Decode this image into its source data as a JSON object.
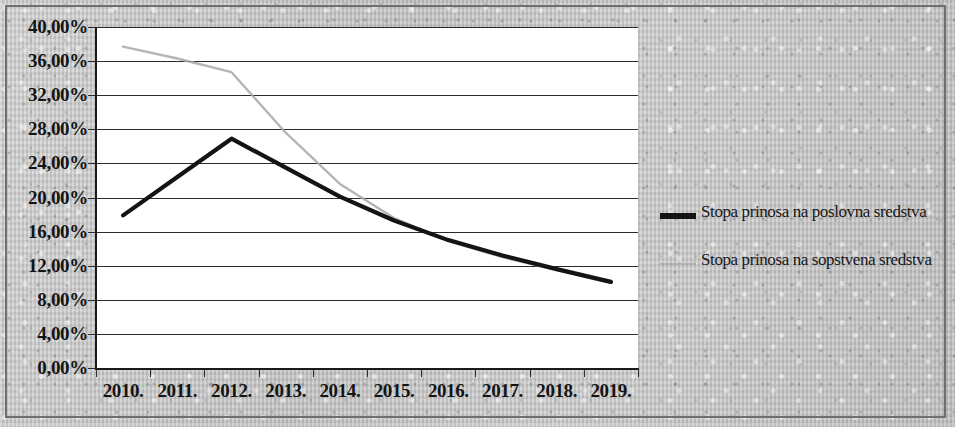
{
  "chart_data": {
    "type": "line",
    "title": "",
    "xlabel": "",
    "ylabel": "",
    "categories": [
      "2010.",
      "2011.",
      "2012.",
      "2013.",
      "2014.",
      "2015.",
      "2016.",
      "2017.",
      "2018.",
      "2019."
    ],
    "ylim": [
      0,
      40
    ],
    "y_tick_step": 4,
    "y_tick_labels": [
      "0,00%",
      "4,00%",
      "8,00%",
      "12,00%",
      "16,00%",
      "20,00%",
      "24,00%",
      "28,00%",
      "32,00%",
      "36,00%",
      "40,00%"
    ],
    "y_tick_values": [
      0,
      4,
      8,
      12,
      16,
      20,
      24,
      28,
      32,
      36,
      40
    ],
    "grid": true,
    "legend_position": "right",
    "series": [
      {
        "name": "Stopa prinosa na poslovna sredstva",
        "color": "#141414",
        "style": "solid",
        "values": [
          17.9,
          22.4,
          26.9,
          23.5,
          20.1,
          17.3,
          15.0,
          13.2,
          11.6,
          10.1
        ]
      },
      {
        "name": "Stopa prinosa na sopstvena sredstva",
        "color": "#a8a8a8",
        "style": "solid-light",
        "values": [
          37.7,
          36.3,
          34.7,
          27.6,
          21.6,
          17.6,
          14.9,
          13.0,
          11.5,
          10.0
        ]
      }
    ]
  },
  "legend": {
    "entries": [
      {
        "label": "Stopa prinosa na poslovna sredstva"
      },
      {
        "label": "Stopa prinosa na sopstvena sredstva"
      }
    ]
  }
}
